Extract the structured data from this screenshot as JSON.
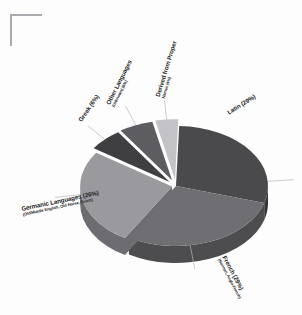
{
  "figure": {
    "background_color": "#fdfdfd",
    "corner_mark_color": "#a9a9ae",
    "label_color": "#1d1d1f"
  },
  "chart_data": {
    "type": "pie",
    "title": "",
    "subtitle": "",
    "xlabel": "",
    "ylabel": "",
    "legend_position": "none",
    "grid": false,
    "three_d": true,
    "exploded": true,
    "start_angle_deg": -88,
    "categories": [
      "Latin",
      "French",
      "Germanic Languages",
      "Greek",
      "Other Languages (Unknown)",
      "Derived from Proper Names"
    ],
    "values": [
      29,
      29,
      26,
      6,
      6,
      4
    ],
    "value_unit": "%",
    "colors": [
      "#4a4a4d",
      "#6f6f73",
      "#9a9a9e",
      "#3f3f42",
      "#5d5d61",
      "#c3c3c7"
    ],
    "slices": [
      {
        "label": "Latin (29%)",
        "name": "Latin",
        "value": 29,
        "color": "#4a4a4d",
        "side_color": "#343437",
        "sub": ""
      },
      {
        "label": "French (29%)",
        "name": "French",
        "value": 29,
        "color": "#6f6f73",
        "side_color": "#4d4d50",
        "sub": "(Norman, Anglo-French)"
      },
      {
        "label": "Germanic Languages (26%)",
        "name": "Germanic Languages",
        "value": 26,
        "color": "#9a9a9e",
        "side_color": "#6d6d71",
        "sub": "(Old/Middle English, Old Norse, Dutch)"
      },
      {
        "label": "Greek (6%)",
        "name": "Greek",
        "value": 6,
        "color": "#3f3f42",
        "side_color": "#2b2b2e",
        "sub": ""
      },
      {
        "label": "Other Languages",
        "name": "Other Languages (Unknown)",
        "value": 6,
        "color": "#5d5d61",
        "side_color": "#414144",
        "sub": "(Unknown) (6%)"
      },
      {
        "label": "Derived from Proper",
        "name": "Derived from Proper Names",
        "value": 4,
        "color": "#c3c3c7",
        "side_color": "#8e8e92",
        "sub": "Names (4%)"
      }
    ]
  }
}
